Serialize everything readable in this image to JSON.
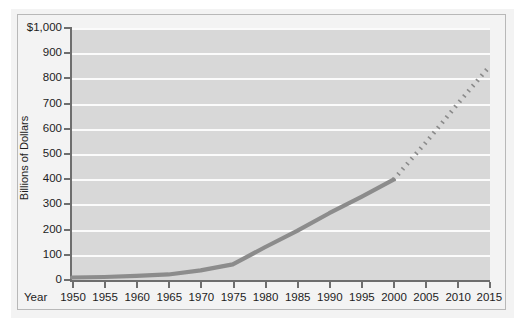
{
  "figure": {
    "background": "#ffffff",
    "plot_background": "#d8d8d8",
    "gridline_color": "#fbfbfb",
    "axis_color": "#6e6e6e",
    "line_color": "#8c8c8c",
    "projection_color": "#8a8a8a"
  },
  "axes": {
    "y_axis_title": "Billions of Dollars",
    "x_axis_title": "Year"
  },
  "chart_data": {
    "type": "line",
    "title": "",
    "subtitle": "",
    "xlabel": "Year",
    "ylabel": "Billions of Dollars",
    "xlim": [
      1950,
      2015
    ],
    "ylim": [
      0,
      1000
    ],
    "grid": true,
    "legend": false,
    "x_tick_labels": [
      "1950",
      "1955",
      "1960",
      "1965",
      "1970",
      "1975",
      "1980",
      "1985",
      "1990",
      "1995",
      "2000",
      "2005",
      "2010",
      "2015"
    ],
    "x_tick_values": [
      1950,
      1955,
      1960,
      1965,
      1970,
      1975,
      1980,
      1985,
      1990,
      1995,
      2000,
      2005,
      2010,
      2015
    ],
    "y_tick_labels": [
      "0",
      "100",
      "200",
      "300",
      "400",
      "500",
      "600",
      "700",
      "800",
      "900",
      "$1,000"
    ],
    "y_tick_values": [
      0,
      100,
      200,
      300,
      400,
      500,
      600,
      700,
      800,
      900,
      1000
    ],
    "series": [
      {
        "name": "Actual",
        "style": "solid",
        "color": "#8c8c8c",
        "x": [
          1950,
          1955,
          1960,
          1965,
          1970,
          1975,
          1980,
          1985,
          1990,
          1995,
          2000
        ],
        "values": [
          10,
          12,
          16,
          22,
          38,
          62,
          130,
          195,
          265,
          330,
          398
        ]
      },
      {
        "name": "Projected",
        "style": "dotted",
        "color": "#8a8a8a",
        "x": [
          2000,
          2005,
          2010,
          2015
        ],
        "values": [
          398,
          545,
          700,
          850
        ]
      }
    ],
    "annotations": []
  }
}
